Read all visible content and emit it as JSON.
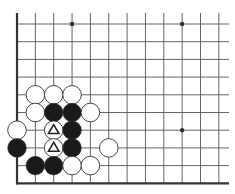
{
  "diagram": {
    "type": "go-board-fragment",
    "board_corner": "bottom-left",
    "visible_columns": 12,
    "visible_rows": 10,
    "colors": {
      "background": "#ffffff",
      "grid": "#555555",
      "edge": "#333333",
      "black_stone": "#1a1a1a",
      "white_stone": "#ffffff",
      "stone_outline": "#333333",
      "marker": "#222222"
    },
    "star_points": [
      {
        "col": 3,
        "row": 0
      },
      {
        "col": 9,
        "row": 0
      },
      {
        "col": 9,
        "row": 6
      }
    ],
    "stones": [
      {
        "col": 1,
        "row": 4,
        "color": "white"
      },
      {
        "col": 2,
        "row": 4,
        "color": "white"
      },
      {
        "col": 3,
        "row": 4,
        "color": "white"
      },
      {
        "col": 1,
        "row": 5,
        "color": "white"
      },
      {
        "col": 2,
        "row": 5,
        "color": "black"
      },
      {
        "col": 3,
        "row": 5,
        "color": "black"
      },
      {
        "col": 4,
        "row": 5,
        "color": "white"
      },
      {
        "col": 0,
        "row": 6,
        "color": "white"
      },
      {
        "col": 2,
        "row": 6,
        "color": "white",
        "marker": "triangle"
      },
      {
        "col": 3,
        "row": 6,
        "color": "black"
      },
      {
        "col": 0,
        "row": 7,
        "color": "black"
      },
      {
        "col": 2,
        "row": 7,
        "color": "white",
        "marker": "triangle"
      },
      {
        "col": 3,
        "row": 7,
        "color": "black"
      },
      {
        "col": 5,
        "row": 7,
        "color": "white"
      },
      {
        "col": 1,
        "row": 8,
        "color": "black"
      },
      {
        "col": 2,
        "row": 8,
        "color": "black"
      },
      {
        "col": 3,
        "row": 8,
        "color": "white"
      },
      {
        "col": 4,
        "row": 8,
        "color": "white"
      }
    ]
  }
}
